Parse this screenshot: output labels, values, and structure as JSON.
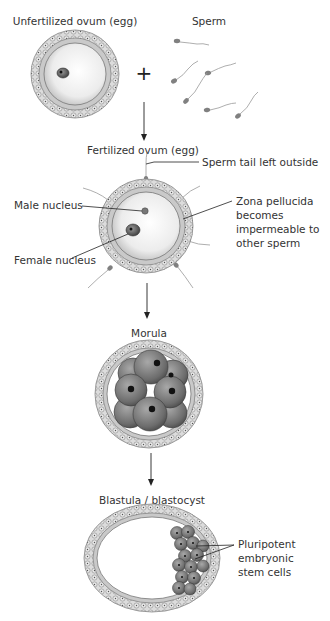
{
  "colors": {
    "line": "#333333",
    "text": "#333333",
    "zona": "#c8c8c8",
    "cumulus": "#d9d9d9",
    "cytoplasm": "#efefef",
    "cell": "#7a7a7a",
    "nucleus": "#111111",
    "sperm_head": "#808080"
  },
  "stages": [
    {
      "id": "unfertilized",
      "label": "Unfertilized ovum (egg)",
      "operator": "+",
      "partner_label": "Sperm"
    },
    {
      "id": "fertilized",
      "label": "Fertilized ovum (egg)",
      "annotations": {
        "sperm_tail": "Sperm tail left outside",
        "male_nucleus": "Male nucleus",
        "female_nucleus": "Female nucleus",
        "zona_line1": "Zona pellucida",
        "zona_line2": "becomes",
        "zona_line3": "impermeable to",
        "zona_line4": "other sperm"
      }
    },
    {
      "id": "morula",
      "label": "Morula"
    },
    {
      "id": "blastula",
      "label": "Blastula / blastocyst",
      "annotations": {
        "stem_line1": "Pluripotent",
        "stem_line2": "embryonic",
        "stem_line3": "stem cells"
      }
    }
  ]
}
